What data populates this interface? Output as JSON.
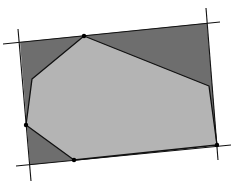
{
  "diagram": {
    "width": 236,
    "height": 187,
    "colors": {
      "background": "#ffffff",
      "outer_fill": "#6e6e6e",
      "inner_fill": "#b4b4b4",
      "stroke": "#111111",
      "vertex": "#000000"
    },
    "outer_rectangle": "20,42 207,23 217,145 30,165",
    "inner_polygon": "84,36 209,86 217,145 74,160 26,125 32,79",
    "lines": [
      {
        "name": "top-line",
        "x1": 3,
        "y1": 44,
        "x2": 220,
        "y2": 22
      },
      {
        "name": "left-line",
        "x1": 18,
        "y1": 29,
        "x2": 31,
        "y2": 181
      },
      {
        "name": "right-line",
        "x1": 206,
        "y1": 8,
        "x2": 218,
        "y2": 160
      },
      {
        "name": "bottom-line",
        "x1": 16,
        "y1": 166,
        "x2": 231,
        "y2": 145
      }
    ],
    "vertices": [
      {
        "name": "vertex-top",
        "cx": 84,
        "cy": 36
      },
      {
        "name": "vertex-bottom-right",
        "cx": 217,
        "cy": 145
      },
      {
        "name": "vertex-bottom",
        "cx": 74,
        "cy": 160
      },
      {
        "name": "vertex-left",
        "cx": 26,
        "cy": 125
      }
    ]
  }
}
